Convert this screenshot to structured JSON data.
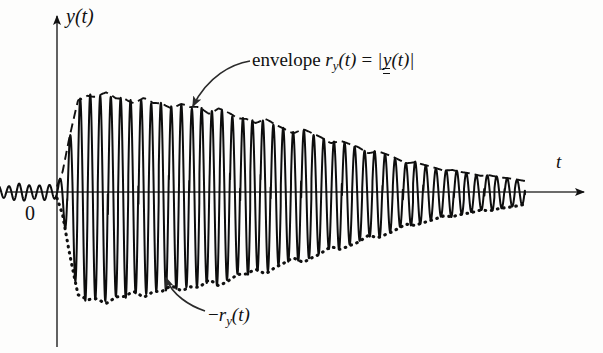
{
  "figure": {
    "title_caption": "",
    "background": "#fdfdfc",
    "ink": "#111111"
  },
  "axes": {
    "y_axis": {
      "label_prefix": "y",
      "label_args": "(t)",
      "x_px": 57,
      "top_px": 10,
      "bottom_px": 348
    },
    "t_axis": {
      "label": "t",
      "y_px": 192,
      "left_px": 6,
      "right_px": 588
    },
    "origin_label": "0"
  },
  "annotations": [
    {
      "name": "envelope-label",
      "text_plain": "envelope r_y(t) = |y(t)|",
      "word": "envelope",
      "sym": "r",
      "sub": "y",
      "args": "(t)",
      "eq": "=",
      "bar_open": "|",
      "inner_sym": "y",
      "inner_args": "(t)",
      "bar_close": "|",
      "arrow_from": [
        248,
        62
      ],
      "arrow_to": [
        190,
        112
      ]
    },
    {
      "name": "negative-envelope-label",
      "text_plain": "-r_y(t)",
      "minus": "−",
      "sym": "r",
      "sub": "y",
      "args": "(t)",
      "arrow_from": [
        205,
        312
      ],
      "arrow_to": [
        164,
        271
      ]
    }
  ],
  "chart_data": {
    "type": "line",
    "title": "",
    "xlabel": "t",
    "ylabel": "y(t)",
    "grid": false,
    "legend": false,
    "xlim": [
      -0.18,
      1.0
    ],
    "ylim": [
      -1.25,
      1.25
    ],
    "carrier_cycles": 46,
    "series": [
      {
        "name": "y(t)",
        "style": "solid",
        "role": "signal"
      },
      {
        "name": "r_y(t)",
        "style": "dashed",
        "role": "upper-envelope"
      },
      {
        "name": "-r_y(t)",
        "style": "dotted",
        "role": "lower-envelope"
      }
    ],
    "envelope_x": [
      -0.17,
      -0.14,
      -0.11,
      -0.08,
      -0.05,
      -0.02,
      0.0,
      0.012,
      0.025,
      0.045,
      0.065,
      0.085,
      0.105,
      0.125,
      0.145,
      0.165,
      0.185,
      0.205,
      0.225,
      0.245,
      0.265,
      0.285,
      0.305,
      0.325,
      0.345,
      0.365,
      0.385,
      0.405,
      0.425,
      0.445,
      0.465,
      0.485,
      0.505,
      0.525,
      0.545,
      0.565,
      0.585,
      0.605,
      0.625,
      0.645,
      0.665,
      0.685,
      0.705,
      0.725,
      0.745,
      0.765,
      0.785,
      0.805,
      0.825,
      0.845,
      0.865,
      0.885,
      0.905,
      0.925,
      0.945,
      0.965,
      0.985,
      1.0
    ],
    "envelope_y": [
      0.055,
      0.07,
      0.05,
      0.085,
      0.06,
      0.075,
      0.055,
      0.2,
      0.5,
      0.92,
      0.985,
      0.955,
      0.975,
      0.93,
      0.95,
      0.9,
      0.925,
      0.875,
      0.895,
      0.855,
      0.875,
      0.83,
      0.85,
      0.8,
      0.84,
      0.78,
      0.73,
      0.745,
      0.7,
      0.72,
      0.665,
      0.64,
      0.6,
      0.625,
      0.575,
      0.545,
      0.5,
      0.515,
      0.47,
      0.44,
      0.395,
      0.415,
      0.37,
      0.33,
      0.29,
      0.305,
      0.27,
      0.24,
      0.215,
      0.225,
      0.2,
      0.18,
      0.16,
      0.17,
      0.15,
      0.135,
      0.12,
      0.11
    ],
    "lower_envelope_scale": 1.12
  }
}
